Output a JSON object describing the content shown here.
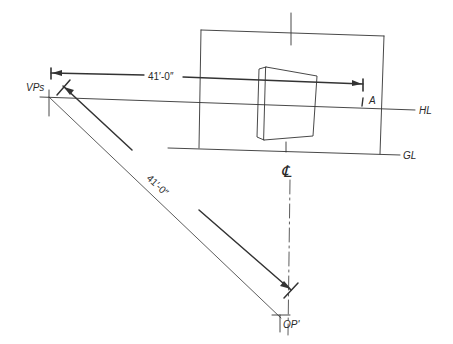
{
  "diagram": {
    "type": "perspective-construction",
    "colors": {
      "line": "#333333",
      "background": "#ffffff"
    },
    "labels": {
      "vanishing_point": "VPs",
      "horizon_line": "HL",
      "ground_line": "GL",
      "point_a": "A",
      "observation_point": "OP'",
      "centerline": "℄"
    },
    "dimensions": {
      "horizontal": "41′-0″",
      "diagonal": "41′-0″"
    }
  }
}
